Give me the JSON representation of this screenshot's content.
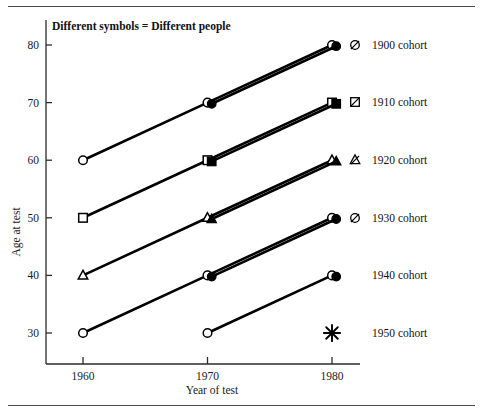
{
  "figure": {
    "note": "Different symbols = Different people",
    "frame_rules": 2
  },
  "axes": {
    "x": {
      "title": "Year of test",
      "ticks": [
        1960,
        1970,
        1980
      ],
      "tick_labels": [
        "1960",
        "1970",
        "1980"
      ],
      "range": [
        1955,
        1985
      ]
    },
    "y": {
      "title": "Age at test",
      "ticks": [
        30,
        40,
        50,
        60,
        70,
        80
      ],
      "tick_labels": [
        "30",
        "40",
        "50",
        "60",
        "70",
        "80"
      ],
      "range": [
        25,
        85
      ]
    }
  },
  "legend": {
    "position": "right",
    "entries": [
      {
        "label": "1900 cohort",
        "marker": "circle-slashed",
        "shape": "circle"
      },
      {
        "label": "1910 cohort",
        "marker": "square-slashed",
        "shape": "square"
      },
      {
        "label": "1920 cohort",
        "marker": "triangle-slashed",
        "shape": "triangle"
      },
      {
        "label": "1930 cohort",
        "marker": "circle-slashed",
        "shape": "circle"
      },
      {
        "label": "1940 cohort",
        "marker": "none",
        "shape": "circle"
      },
      {
        "label": "1950 cohort",
        "marker": "none",
        "shape": "asterisk"
      }
    ]
  },
  "chart_data": {
    "type": "line",
    "title": "",
    "subtitle": "Different symbols = Different people",
    "xlabel": "Year of test",
    "ylabel": "Age at test",
    "xlim": [
      1955,
      1985
    ],
    "ylim": [
      25,
      85
    ],
    "grid": false,
    "legend_position": "right",
    "x": [
      1960,
      1970,
      1980
    ],
    "series": [
      {
        "name": "1900 cohort",
        "shape": "circle",
        "fill": "open",
        "x": [
          1960,
          1970,
          1980
        ],
        "values": [
          60,
          70,
          80
        ]
      },
      {
        "name": "1900 cohort",
        "shape": "circle",
        "fill": "filled",
        "x": [
          1970,
          1980
        ],
        "values": [
          70,
          80
        ]
      },
      {
        "name": "1910 cohort",
        "shape": "square",
        "fill": "open",
        "x": [
          1960,
          1970,
          1980
        ],
        "values": [
          50,
          60,
          70
        ]
      },
      {
        "name": "1910 cohort",
        "shape": "square",
        "fill": "filled",
        "x": [
          1970,
          1980
        ],
        "values": [
          60,
          70
        ]
      },
      {
        "name": "1920 cohort",
        "shape": "triangle",
        "fill": "open",
        "x": [
          1960,
          1970,
          1980
        ],
        "values": [
          40,
          50,
          60
        ]
      },
      {
        "name": "1920 cohort",
        "shape": "triangle",
        "fill": "filled",
        "x": [
          1970,
          1980
        ],
        "values": [
          50,
          60
        ]
      },
      {
        "name": "1930 cohort",
        "shape": "circle",
        "fill": "open",
        "x": [
          1960,
          1970,
          1980
        ],
        "values": [
          30,
          40,
          50
        ]
      },
      {
        "name": "1930 cohort",
        "shape": "circle",
        "fill": "filled",
        "x": [
          1970,
          1980
        ],
        "values": [
          40,
          50
        ]
      },
      {
        "name": "1940 cohort",
        "shape": "circle",
        "fill": "open",
        "x": [
          1970,
          1980
        ],
        "values": [
          30,
          40
        ]
      },
      {
        "name": "1940 cohort",
        "shape": "circle",
        "fill": "filled",
        "x": [
          1980
        ],
        "values": [
          40
        ]
      },
      {
        "name": "1950 cohort",
        "shape": "asterisk",
        "fill": "filled",
        "x": [
          1980
        ],
        "values": [
          30
        ]
      }
    ],
    "annotations": [
      {
        "text": "Different symbols = Different people",
        "x": 1957.5,
        "y": 84
      }
    ]
  },
  "colors": {
    "ink": "#000000",
    "axis": "#2b2b2b",
    "rule": "#4a4a4a",
    "paper": "#ffffff"
  }
}
